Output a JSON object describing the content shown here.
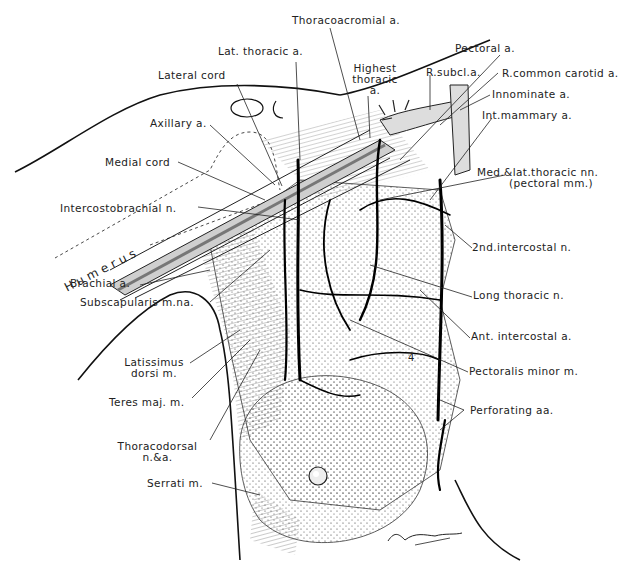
{
  "figure": {
    "signature": "Leo Schlossberg",
    "region_number": "4",
    "humerus_label": "Humerus"
  },
  "labels": {
    "thoracoacromial": "Thoracoacromial a.",
    "lat_thoracic": "Lat. thoracic a.",
    "lateral_cord": "Lateral cord",
    "highest_thoracic_1": "Highest",
    "highest_thoracic_2": "thoracic",
    "highest_thoracic_3": "a.",
    "pectoral": "Pectoral a.",
    "r_subcl": "R.subcl.a.",
    "r_common_carotid": "R.common carotid a.",
    "innominate": "Innominate a.",
    "int_mammary": "Int.mammary a.",
    "axillary": "Axillary a.",
    "medial_cord": "Medial cord",
    "med_lat_thoracic_1": "Med.&lat.thoracic nn.",
    "med_lat_thoracic_2": "(pectoral mm.)",
    "intercostobrachial": "Intercostobrachial n.",
    "second_intercostal": "2nd.intercostal n.",
    "brachial": "Brachial a.",
    "subscapularis": "Subscapularis m.na.",
    "long_thoracic": "Long thoracic n.",
    "ant_intercostal": "Ant. intercostal a.",
    "latissimus_1": "Latissimus",
    "latissimus_2": "dorsi m.",
    "pectoralis_minor": "Pectoralis minor m.",
    "teres_maj": "Teres maj. m.",
    "perforating": "Perforating aa.",
    "thoracodorsal_1": "Thoracodorsal",
    "thoracodorsal_2": "n.&a.",
    "serrati": "Serrati m."
  }
}
